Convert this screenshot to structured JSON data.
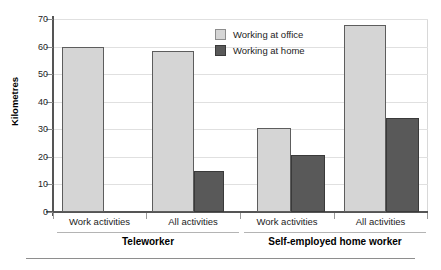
{
  "chart_data": {
    "type": "bar",
    "title": "",
    "xlabel": "",
    "ylabel": "Kilometres",
    "ylim": [
      0,
      70
    ],
    "yticks": [
      0,
      10,
      20,
      30,
      40,
      50,
      60,
      70
    ],
    "grid": true,
    "legend_position": "top-right-inside",
    "categories": [
      "Work activities",
      "All activities",
      "Work activities",
      "All activities"
    ],
    "groups": [
      {
        "name": "Teleworker",
        "categories": [
          "Work activities",
          "All activities"
        ]
      },
      {
        "name": "Self-employed home worker",
        "categories": [
          "Work activities",
          "All activities"
        ]
      }
    ],
    "series": [
      {
        "name": "Working at office",
        "color": "#d5d5d5",
        "values": [
          60,
          58.5,
          30.5,
          68
        ]
      },
      {
        "name": "Working at home",
        "color": "#595959",
        "values": [
          0,
          15,
          20.5,
          34
        ]
      }
    ]
  },
  "axis": {
    "y_title": "Kilometres",
    "tick_labels": [
      "70",
      "60",
      "50",
      "40",
      "30",
      "20",
      "10",
      "0"
    ]
  },
  "legend": {
    "items": [
      {
        "label": "Working at office",
        "swatch": "office"
      },
      {
        "label": "Working at home",
        "swatch": "home"
      }
    ]
  },
  "category_labels": [
    "Work activities",
    "All activities",
    "Work activities",
    "All activities"
  ],
  "super_labels": [
    "Teleworker",
    "Self-employed home worker"
  ]
}
